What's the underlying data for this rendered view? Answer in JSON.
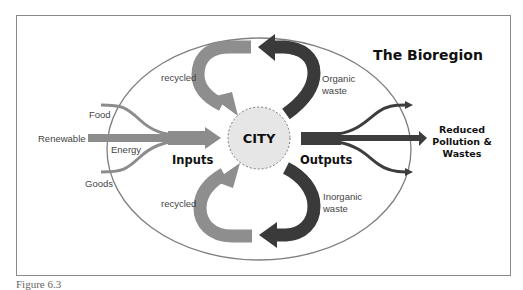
{
  "figure": {
    "title": "The Bioregion",
    "caption": "Figure 6.3",
    "center": {
      "label": "CITY"
    },
    "inputs": {
      "group_label": "Inputs",
      "sources": [
        "Food",
        "Renewable",
        "Energy",
        "Goods"
      ],
      "renewable_energy_label": [
        "Renewable",
        "Energy"
      ]
    },
    "outputs": {
      "group_label": "Outputs",
      "destination": [
        "Reduced",
        "Pollution &",
        "Wastes"
      ]
    },
    "loops": {
      "top_left": "recycled",
      "top_right": [
        "Organic",
        "waste"
      ],
      "bottom_left": "recycled",
      "bottom_right": [
        "Inorganic",
        "waste"
      ]
    },
    "colors": {
      "frame": "#8a8a8a",
      "ellipse": "#7f7f7f",
      "input_arrows": "#8c8c8c",
      "recycled_arrows": "#8e8e8e",
      "waste_arrows": "#3a3a3a",
      "output_arrows": "#3d3d3d",
      "city_fill": "#e6e6e6",
      "city_border": "#777777"
    }
  }
}
